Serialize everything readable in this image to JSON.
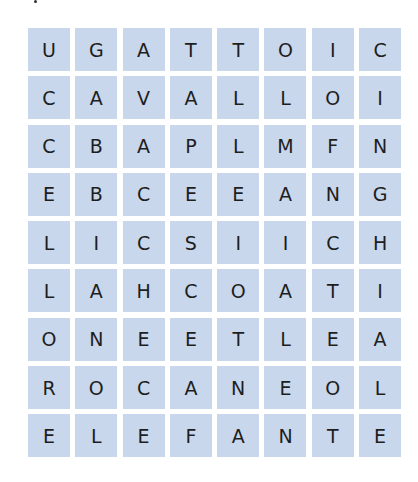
{
  "puzzle": {
    "type": "word-search",
    "cell_color": "#c8d7ec",
    "text_color": "#1e1e1e",
    "rows": [
      [
        "U",
        "G",
        "A",
        "T",
        "T",
        "O",
        "I",
        "C"
      ],
      [
        "C",
        "A",
        "V",
        "A",
        "L",
        "L",
        "O",
        "I"
      ],
      [
        "C",
        "B",
        "A",
        "P",
        "L",
        "M",
        "F",
        "N"
      ],
      [
        "E",
        "B",
        "C",
        "E",
        "E",
        "A",
        "N",
        "G"
      ],
      [
        "L",
        "I",
        "C",
        "S",
        "I",
        "I",
        "C",
        "H"
      ],
      [
        "L",
        "A",
        "H",
        "C",
        "O",
        "A",
        "T",
        "I"
      ],
      [
        "O",
        "N",
        "E",
        "E",
        "T",
        "L",
        "E",
        "A"
      ],
      [
        "R",
        "O",
        "C",
        "A",
        "N",
        "E",
        "O",
        "L"
      ],
      [
        "E",
        "L",
        "E",
        "F",
        "A",
        "N",
        "T",
        "E"
      ]
    ]
  }
}
